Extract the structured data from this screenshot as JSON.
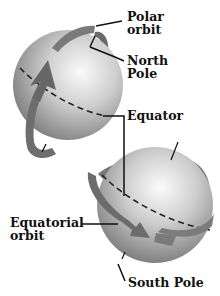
{
  "diagram": {
    "type": "orbit-illustration",
    "labels": {
      "polar_orbit_l1": "Polar",
      "polar_orbit_l2": "orbit",
      "north_pole_l1": "North",
      "north_pole_l2": "Pole",
      "equator": "Equator",
      "equatorial_orbit_l1": "Equatorial",
      "equatorial_orbit_l2": "orbit",
      "south_pole": "South Pole"
    },
    "colors": {
      "sphere_light": "#f4f4f4",
      "sphere_mid": "#b8b8b8",
      "sphere_dark": "#6e6e6e",
      "orbit_band": "#7a7a7a",
      "orbit_band_dark": "#5a5a5a",
      "line": "#111111"
    }
  }
}
